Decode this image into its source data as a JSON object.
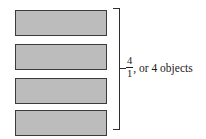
{
  "figure": {
    "caption_fraction": {
      "numerator": "4",
      "denominator": "1"
    },
    "caption_text": ", or 4 objects",
    "bars": [
      {
        "index": 1,
        "label": "object-bar-1"
      },
      {
        "index": 2,
        "label": "object-bar-2"
      },
      {
        "index": 3,
        "label": "object-bar-3"
      },
      {
        "index": 4,
        "label": "object-bar-4"
      }
    ],
    "colors": {
      "bar_fill": "#bcbcbc",
      "bar_border": "#3b3b3b",
      "bracket": "#2e2e2e",
      "text": "#1a1a1a",
      "background": "#ffffff"
    }
  }
}
